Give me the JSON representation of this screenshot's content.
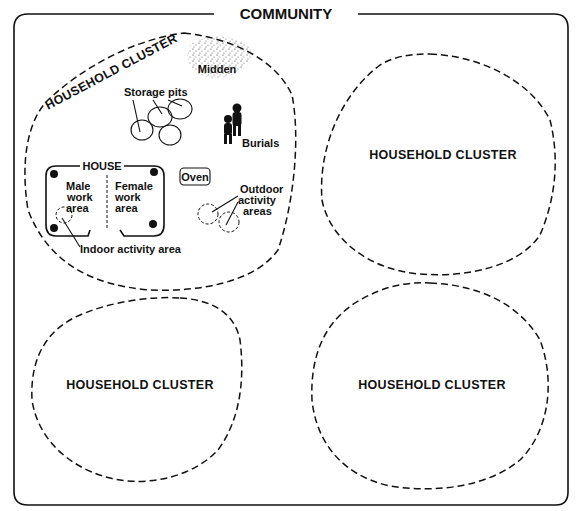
{
  "diagram": {
    "title": "COMMUNITY",
    "primary_cluster": {
      "label": "HOUSEHOLD CLUSTER",
      "features": {
        "midden": "Midden",
        "storage_pits": "Storage pits",
        "burials": "Burials",
        "house": "HOUSE",
        "male_area": [
          "Male",
          "work",
          "area"
        ],
        "female_area": [
          "Female",
          "work",
          "area"
        ],
        "oven": "Oven",
        "outdoor": [
          "Outdoor",
          "activity",
          "areas"
        ],
        "indoor": "Indoor activity area"
      }
    },
    "other_clusters": [
      {
        "label": "HOUSEHOLD CLUSTER"
      },
      {
        "label": "HOUSEHOLD CLUSTER"
      },
      {
        "label": "HOUSEHOLD CLUSTER"
      }
    ],
    "colors": {
      "ink": "#111111",
      "background": "#ffffff"
    }
  }
}
